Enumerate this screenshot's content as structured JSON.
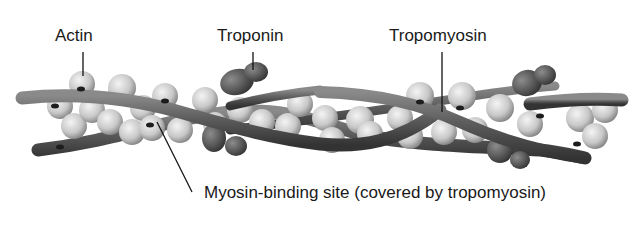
{
  "diagram": {
    "labels": {
      "actin": "Actin",
      "troponin": "Troponin",
      "tropomyosin": "Tropomyosin",
      "myosin_binding_site": "Myosin-binding site (covered by tropomyosin)"
    },
    "colors": {
      "background": "#ffffff",
      "text": "#1a1a1a",
      "leader_line": "#111111",
      "actin_light": "#e6e6e6",
      "actin_dark": "#8a8a8a",
      "tropomyosin": "#5a5a5a",
      "troponin": "#4a4a4a"
    }
  }
}
